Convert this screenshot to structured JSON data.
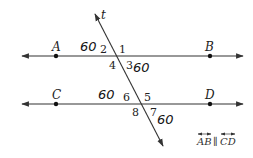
{
  "diagram": {
    "type": "parallel lines cut by a transversal",
    "transversal": {
      "label": "t"
    },
    "lines": [
      {
        "id": "AB",
        "points": [
          "A",
          "B"
        ]
      },
      {
        "id": "CD",
        "points": [
          "C",
          "D"
        ]
      }
    ],
    "points": {
      "A": "A",
      "B": "B",
      "C": "C",
      "D": "D"
    },
    "angle_numbers": {
      "a1": "1",
      "a2": "2",
      "a3": "3",
      "a4": "4",
      "a5": "5",
      "a6": "6",
      "a7": "7",
      "a8": "8"
    },
    "handwritten_values": {
      "angle2": "60",
      "angle3": "60",
      "angle6": "60",
      "angle7": "60"
    },
    "given_note": {
      "left": "AB",
      "symbol": "∥",
      "right": "CD"
    },
    "colors": {
      "lines": "#333333",
      "text": "#222222"
    }
  }
}
